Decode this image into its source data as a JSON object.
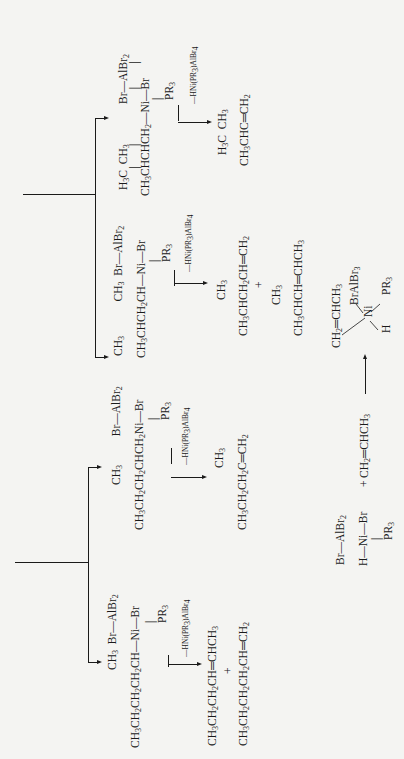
{
  "diagram": {
    "orientation": "rotated-90-ccw",
    "branches": [
      {
        "id": "branch-upper",
        "routes": [
          {
            "intermediate": {
              "top_line": "H3C  CH3        Br—AlBr2",
              "main_line": "CH3CHCHCH2—Ni—Br",
              "ligand": "PR3"
            },
            "elimination_label": "—HNi(PR3)AlBr4",
            "products": [
              {
                "top": "H3C  CH3",
                "main": "CH3CHC═CH2"
              }
            ]
          },
          {
            "intermediate": {
              "top_line": "CH3          CH3  Br—AlBr2",
              "main_line": "CH3CHCH2CH—Ni—Br",
              "ligand": "PR3"
            },
            "elimination_label": "—HNi(PR3)AlBr4",
            "products": [
              {
                "top": "CH3",
                "main": "CH3CHCH2CH═CH2"
              },
              {
                "top": "CH3",
                "main": "CH3CHCH═CHCH3"
              }
            ],
            "plus": "+"
          }
        ]
      },
      {
        "id": "branch-lower",
        "routes": [
          {
            "intermediate": {
              "top_line": "CH3       Br—AlBr2",
              "main_line": "CH3CH2CH2CHCH2Ni—Br",
              "ligand": "PR3"
            },
            "elimination_label": "—HNi(PR3)AlBr4",
            "products": [
              {
                "top": "CH3",
                "main": "CH3CH2CH2C═CH2"
              }
            ]
          },
          {
            "intermediate": {
              "top_line": "CH3  Br—AlBr2",
              "main_line": "CH3CH2CH2CH2CH—Ni—Br",
              "ligand": "PR3"
            },
            "elimination_label": "—HNi(PR3)AlBr4",
            "products": [
              {
                "main": "CH3CH2CH2CH═CHCH3"
              },
              {
                "main": "CH3CH2CH2CH2CH═CH2"
              }
            ],
            "plus": "+"
          }
        ]
      }
    ],
    "initiation": {
      "catalyst_top": "Br—AlBr2",
      "catalyst_main": "H—Ni—Br",
      "catalyst_ligand": "PR3",
      "plus": "+",
      "olefin": "CH2═CHCH3",
      "complex_olefin": "CH2═CHCH3",
      "complex_ni": "Ni",
      "complex_bralbr3": "BrAlBr3",
      "complex_pr3": "PR3",
      "complex_h": "H"
    }
  }
}
